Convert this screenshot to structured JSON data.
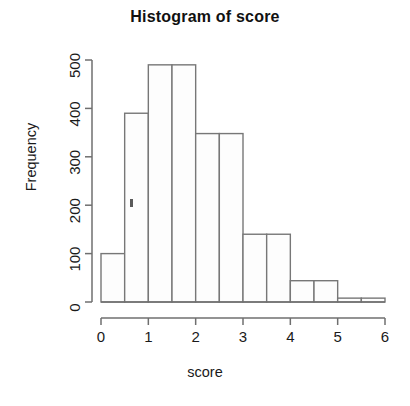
{
  "chart_data": {
    "type": "bar",
    "title": "Histogram of score",
    "xlabel": "score",
    "ylabel": "Frequency",
    "bin_width": 0.5,
    "categories": [
      "0-0.5",
      "0.5-1",
      "1-1.5",
      "1.5-2",
      "2-2.5",
      "2.5-3",
      "3-3.5",
      "3.5-4",
      "4-4.5",
      "4.5-5",
      "5-5.5",
      "5.5-6"
    ],
    "bin_edges": [
      0,
      0.5,
      1,
      1.5,
      2,
      2.5,
      3,
      3.5,
      4,
      4.5,
      5,
      5.5,
      6
    ],
    "values": [
      100,
      390,
      490,
      490,
      348,
      348,
      140,
      140,
      44,
      44,
      8,
      8
    ],
    "bars": [
      {
        "x0": 0.0,
        "x1": 0.5,
        "value": 100
      },
      {
        "x0": 0.5,
        "x1": 1.0,
        "value": 390
      },
      {
        "x0": 1.0,
        "x1": 1.5,
        "value": 490
      },
      {
        "x0": 1.5,
        "x1": 2.0,
        "value": 490
      },
      {
        "x0": 2.0,
        "x1": 2.5,
        "value": 348
      },
      {
        "x0": 2.5,
        "x1": 3.0,
        "value": 348
      },
      {
        "x0": 3.0,
        "x1": 3.5,
        "value": 140
      },
      {
        "x0": 3.5,
        "x1": 4.0,
        "value": 140
      },
      {
        "x0": 4.0,
        "x1": 4.5,
        "value": 44
      },
      {
        "x0": 4.5,
        "x1": 5.0,
        "value": 44
      },
      {
        "x0": 5.0,
        "x1": 5.5,
        "value": 8
      },
      {
        "x0": 5.5,
        "x1": 6.0,
        "value": 8
      }
    ],
    "xlim": [
      0,
      6
    ],
    "ylim": [
      0,
      500
    ],
    "xticks": [
      0,
      1,
      2,
      3,
      4,
      5,
      6
    ],
    "xtick_labels": [
      "0",
      "1",
      "2",
      "3",
      "4",
      "5",
      "6"
    ],
    "yticks": [
      0,
      100,
      200,
      300,
      400,
      500
    ],
    "ytick_labels": [
      "0",
      "100",
      "200",
      "300",
      "400",
      "500"
    ],
    "grid": false,
    "legend": false,
    "bar_fill_color": "#fdfdfd",
    "bar_border_color": "#777777",
    "axis_color": "#6f6f6f",
    "background_color": "#ffffff"
  }
}
